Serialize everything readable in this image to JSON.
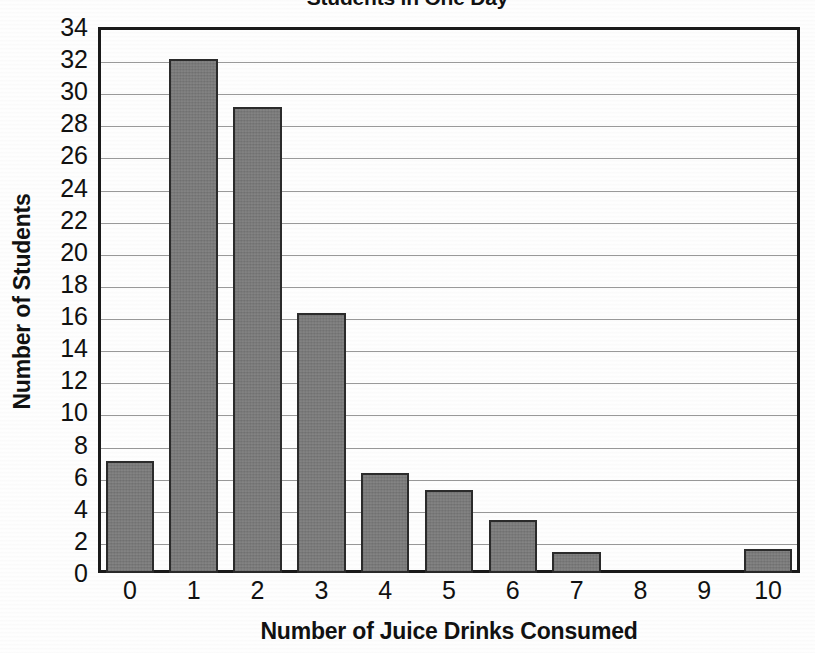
{
  "chart_data": {
    "type": "bar",
    "title": "Students in One Day",
    "xlabel": "Number of Juice Drinks Consumed",
    "ylabel": "Number of Students",
    "categories": [
      "0",
      "1",
      "2",
      "3",
      "4",
      "5",
      "6",
      "7",
      "8",
      "9",
      "10"
    ],
    "values": [
      7,
      32,
      29,
      16.2,
      6.2,
      5.2,
      3.3,
      1.3,
      0,
      0,
      1.5
    ],
    "ylim": [
      0,
      34
    ],
    "ytick_step": 2,
    "yticks": [
      "34",
      "32",
      "30",
      "28",
      "26",
      "24",
      "22",
      "20",
      "18",
      "16",
      "14",
      "12",
      "10",
      "8",
      "6",
      "4",
      "2",
      "0"
    ],
    "grid": true,
    "legend": "none",
    "bar_color": "#7d7d7d",
    "bar_border_color": "#2b2b2b",
    "gridline_color": "#9a9a9a",
    "axis_color": "#1a1a1a",
    "background": "#ffffff"
  }
}
